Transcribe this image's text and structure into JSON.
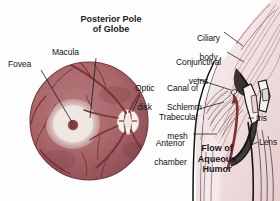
{
  "figure": {
    "kind": "medical-illustration",
    "background_color": "#fdfdfd"
  },
  "title": {
    "line1": "Posterior Pole",
    "line2": "of Globe"
  },
  "labels": {
    "macula": "Macula",
    "fovea": "Fovea",
    "optic_disk_l1": "Optic",
    "optic_disk_l2": "disk",
    "ciliary_body_l1": "Ciliary",
    "ciliary_body_l2": "body",
    "conjunctival_l1": "Conjunctival",
    "conjunctival_l2": "veins",
    "canal_l1": "Canal of",
    "canal_l2": "Schlemm",
    "trabecular_l1": "Trabecular",
    "trabecular_l2": "mesh",
    "anterior_l1": "Anterior",
    "anterior_l2": "chamber",
    "iris": "Iris",
    "lens": "Lens"
  },
  "callout": {
    "flow_l1": "Flow of",
    "flow_l2": "Aqueous",
    "flow_l3": "Humor"
  },
  "colors": {
    "fundus_fill": "#a8666a",
    "fundus_edge": "#7d4448",
    "vessel": "#7e3338",
    "macula_pale": "#efe6e2",
    "fovea_dot": "#8d4a4d",
    "optic_disk": "#f5eeea",
    "sclera_pink": "#f0dcdc",
    "chamber_pink": "#f3e3e5",
    "tissue_line": "#8b5a60",
    "arrow": "#7d2f35",
    "ink": "#141414"
  }
}
